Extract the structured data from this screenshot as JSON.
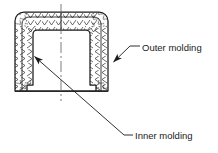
{
  "figure": {
    "type": "engineering-cross-section",
    "width": 218,
    "height": 153,
    "background_color": "#ffffff",
    "line_color": "#1a1a1a",
    "hatch_color": "#2b2b2b"
  },
  "callouts": [
    {
      "id": "outer",
      "label": "Outer molding",
      "text_x": 142,
      "text_y": 48,
      "leader": {
        "arrow_tip_x": 112,
        "arrow_tip_y": 63,
        "elbow_x": 130,
        "elbow_y": 46,
        "end_x": 140,
        "end_y": 46
      }
    },
    {
      "id": "inner",
      "label": "Inner molding",
      "text_x": 135,
      "text_y": 135,
      "leader": {
        "arrow_tip_x": 33,
        "arrow_tip_y": 55,
        "elbow_x": 124,
        "elbow_y": 135,
        "end_x": 133,
        "end_y": 135
      }
    }
  ],
  "centerline": {
    "name": "axis-centerline",
    "x": 61,
    "y_top": 4,
    "y_bottom": 101,
    "style": "dash-dot"
  },
  "geometry": {
    "outer_left": 15,
    "outer_right": 108,
    "outer_top": 12,
    "outer_bottom": 91,
    "corner_radius": 9,
    "wall_thickness": 12,
    "flange_bottom": 91,
    "flange_step": 6,
    "cavity_left": 33,
    "cavity_right": 90,
    "cavity_top": 30,
    "cavity_bottom": 84
  }
}
